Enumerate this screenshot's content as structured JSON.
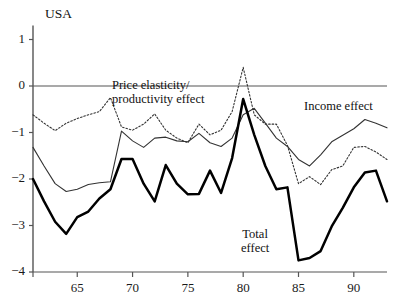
{
  "chart_data": {
    "type": "line",
    "title": "USA",
    "xlabel": "",
    "ylabel": "",
    "xlim": [
      61,
      93
    ],
    "ylim": [
      -4,
      1.3
    ],
    "yticks": [
      1,
      0,
      -1,
      -2,
      -3,
      -4
    ],
    "ytick_labels": [
      "1",
      "0",
      "−1",
      "−2",
      "−3",
      "−4"
    ],
    "xticks": [
      65,
      70,
      75,
      80,
      85,
      90
    ],
    "xtick_labels": [
      "65",
      "70",
      "75",
      "80",
      "85",
      "90"
    ],
    "grid": false,
    "zero_line": true,
    "legend_position": "inline-annotations",
    "x": [
      61,
      62,
      63,
      64,
      65,
      66,
      67,
      68,
      69,
      70,
      71,
      72,
      73,
      74,
      75,
      76,
      77,
      78,
      79,
      80,
      81,
      82,
      83,
      84,
      85,
      86,
      87,
      88,
      89,
      90,
      91,
      92,
      93
    ],
    "series": [
      {
        "name": "Price elasticity/productivity effect",
        "style": "dotted",
        "color": "#333333",
        "values": [
          -0.62,
          -0.8,
          -0.96,
          -0.8,
          -0.7,
          -0.62,
          -0.55,
          -0.25,
          -0.88,
          -0.95,
          -0.82,
          -0.6,
          -0.95,
          -1.12,
          -1.22,
          -0.82,
          -1.05,
          -0.95,
          -0.55,
          0.4,
          -0.62,
          -0.82,
          -0.82,
          -1.28,
          -2.1,
          -1.95,
          -2.12,
          -1.8,
          -1.72,
          -1.32,
          -1.3,
          -1.42,
          -1.58
        ]
      },
      {
        "name": "Income effect",
        "style": "solid-thin",
        "color": "#333333",
        "values": [
          -1.32,
          -1.72,
          -2.1,
          -2.27,
          -2.22,
          -2.12,
          -2.08,
          -2.06,
          -0.97,
          -1.18,
          -1.32,
          -1.12,
          -1.1,
          -1.18,
          -1.2,
          -1.02,
          -1.22,
          -1.3,
          -1.12,
          -0.62,
          -0.48,
          -0.8,
          -1.12,
          -1.3,
          -1.58,
          -1.72,
          -1.48,
          -1.2,
          -1.06,
          -0.92,
          -0.72,
          -0.8,
          -0.9
        ]
      },
      {
        "name": "Total effect",
        "style": "solid-thick",
        "color": "#000000",
        "values": [
          -2.0,
          -2.48,
          -2.92,
          -3.18,
          -2.82,
          -2.7,
          -2.42,
          -2.22,
          -1.57,
          -1.57,
          -2.1,
          -2.48,
          -1.7,
          -2.1,
          -2.33,
          -2.32,
          -1.82,
          -2.3,
          -1.55,
          -0.28,
          -1.05,
          -1.72,
          -2.22,
          -2.18,
          -3.75,
          -3.7,
          -3.55,
          -3.02,
          -2.62,
          -2.18,
          -1.86,
          -1.82,
          -2.48
        ]
      }
    ],
    "annotations": [
      {
        "id": "price-elasticity",
        "lines": [
          "Price elasticity/",
          "productivity effect"
        ],
        "x_px": 112,
        "y_px": 78
      },
      {
        "id": "income-effect",
        "lines": [
          "Income effect"
        ],
        "x_px": 304,
        "y_px": 99
      },
      {
        "id": "total-effect",
        "lines": [
          "Total",
          "effect"
        ],
        "x_px": 241,
        "y_px": 227
      }
    ]
  }
}
